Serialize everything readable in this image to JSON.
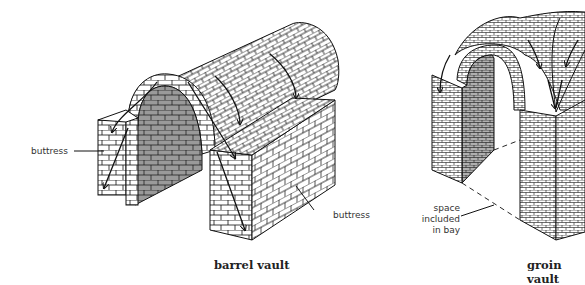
{
  "figure": {
    "panels": [
      {
        "id": "barrel",
        "caption": "barrel vault",
        "labels": [
          {
            "text": "buttress",
            "side": "left"
          },
          {
            "text": "buttress",
            "side": "right"
          }
        ]
      },
      {
        "id": "groin",
        "caption": "groin vault",
        "labels": [
          {
            "text": "space included in bay",
            "lines": [
              "space",
              "included",
              "in bay"
            ]
          }
        ]
      }
    ]
  },
  "colors": {
    "line": "#111111",
    "shade": "#9a9a9a",
    "background": "#ffffff"
  }
}
